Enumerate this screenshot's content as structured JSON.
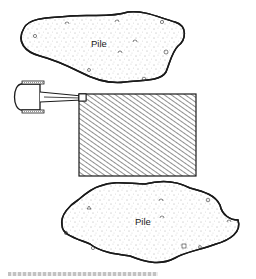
{
  "diagram": {
    "type": "excavation-layout",
    "elements": [
      {
        "id": "pile-top",
        "kind": "stockpile",
        "label": "Pile"
      },
      {
        "id": "excavation-area",
        "kind": "hatched-rectangle",
        "label": ""
      },
      {
        "id": "excavator",
        "kind": "machine-plan-view",
        "label": ""
      },
      {
        "id": "pile-bottom",
        "kind": "stockpile",
        "label": "Pile"
      }
    ]
  },
  "labels": {
    "pile_top": "Pile",
    "pile_bottom": "Pile"
  },
  "colors": {
    "ink": "#1a1a1a",
    "background": "#ffffff",
    "hatch": "#333333"
  }
}
